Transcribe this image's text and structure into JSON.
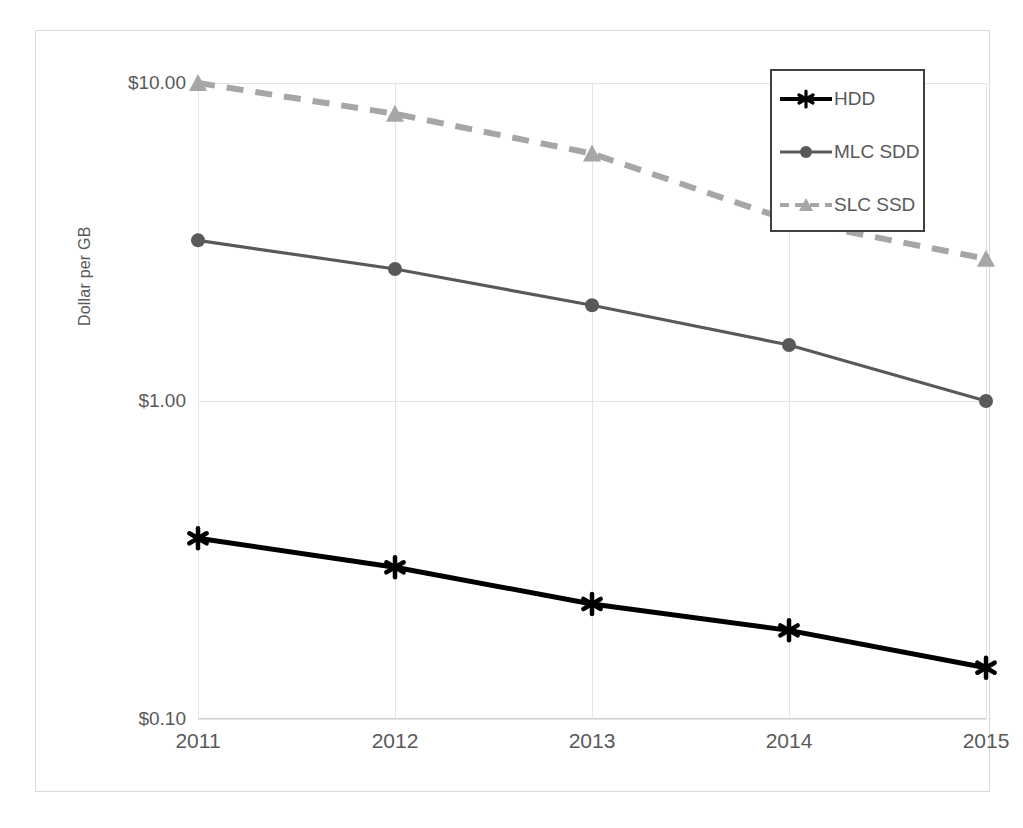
{
  "chart_data": {
    "type": "line",
    "title": "",
    "xlabel": "",
    "ylabel": "Dollar per GB",
    "x": [
      2011,
      2012,
      2013,
      2014,
      2015
    ],
    "categories": [
      "2011",
      "2012",
      "2013",
      "2014",
      "2015"
    ],
    "yscale": "log",
    "ylim": [
      0.1,
      10.0
    ],
    "yticks": [
      10.0,
      1.0,
      0.1
    ],
    "ytick_labels": [
      "$10.00",
      "$1.00",
      "$0.10"
    ],
    "grid": true,
    "legend_position": "top-right",
    "series": [
      {
        "name": "HDD",
        "values": [
          0.37,
          0.3,
          0.23,
          0.19,
          0.145
        ],
        "color": "#000000",
        "marker": "star",
        "linestyle": "solid"
      },
      {
        "name": "MLC SDD",
        "values": [
          3.2,
          2.6,
          2.0,
          1.5,
          1.0
        ],
        "color": "#595959",
        "marker": "circle",
        "linestyle": "solid"
      },
      {
        "name": "SLC SSD",
        "values": [
          10.0,
          8.0,
          6.0,
          3.7,
          2.8
        ],
        "color": "#a6a6a6",
        "marker": "triangle",
        "linestyle": "dashed"
      }
    ]
  },
  "legend": {
    "items": [
      {
        "label": "HDD"
      },
      {
        "label": "MLC SDD"
      },
      {
        "label": "SLC SSD"
      }
    ]
  },
  "colors": {
    "hdd": "#000000",
    "mlc": "#595959",
    "slc": "#a6a6a6",
    "grid": "#e4e4e4",
    "text": "#595959",
    "frame": "#d9d9d9",
    "legend_border": "#3f3f3f"
  }
}
